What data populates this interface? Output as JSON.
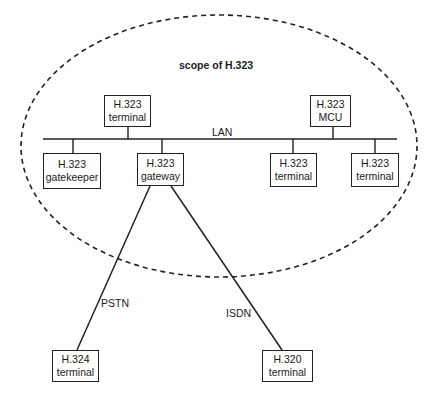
{
  "title": "scope of H.323",
  "network_labels": {
    "lan": "LAN",
    "pstn": "PSTN",
    "isdn": "ISDN"
  },
  "nodes": {
    "terminal_top": {
      "line1": "H.323",
      "line2": "terminal"
    },
    "mcu": {
      "line1": "H.323",
      "line2": "MCU"
    },
    "gatekeeper": {
      "line1": "H.323",
      "line2": "gatekeeper"
    },
    "gateway": {
      "line1": "H.323",
      "line2": "gateway"
    },
    "terminal_right1": {
      "line1": "H.323",
      "line2": "terminal"
    },
    "terminal_right2": {
      "line1": "H.323",
      "line2": "terminal"
    },
    "h324": {
      "line1": "H.324",
      "line2": "terminal"
    },
    "h320": {
      "line1": "H.320",
      "line2": "terminal"
    }
  }
}
